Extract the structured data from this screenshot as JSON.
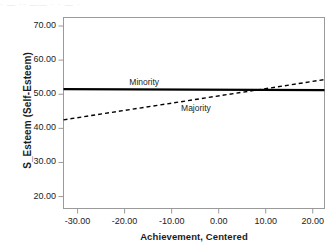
{
  "figure": {
    "background_color": "#ffffff",
    "frame_color": "#9a9a9a",
    "line_color": "#000000",
    "top_artifact_text": "· — ·· —— · · — ·"
  },
  "chart_data": {
    "type": "line",
    "title": "",
    "xlabel": "Achievement, Centered",
    "ylabel": "S_Esteem (Self-Esteem)",
    "xlim": [
      -33.0,
      22.5
    ],
    "ylim": [
      16.5,
      72.5
    ],
    "xticks": [
      -30.0,
      -20.0,
      -10.0,
      0.0,
      10.0,
      20.0
    ],
    "xtick_labels": [
      "-30.00",
      "-20.00",
      "-10.00",
      "0.00",
      "10.00",
      "20.00"
    ],
    "yticks": [
      20.0,
      30.0,
      40.0,
      50.0,
      60.0,
      70.0
    ],
    "ytick_labels": [
      "20.00",
      "30.00",
      "40.00",
      "50.00",
      "60.00",
      "70.00"
    ],
    "grid": false,
    "legend_position": "inline-annotations",
    "series": [
      {
        "name": "Minority",
        "style": "solid",
        "linewidth": 2.2,
        "color": "#000000",
        "x": [
          -33.0,
          22.5
        ],
        "values": [
          51.5,
          51.2
        ],
        "annotation": {
          "text": "Minority",
          "x": -19.0,
          "y": 53.2
        }
      },
      {
        "name": "Majority",
        "style": "dashed",
        "linewidth": 1.4,
        "color": "#000000",
        "x": [
          -33.0,
          22.5
        ],
        "values": [
          42.5,
          54.3
        ],
        "annotation": {
          "text": "Majority",
          "x": -8.0,
          "y": 45.6
        }
      }
    ],
    "intersection": {
      "x": 8.2,
      "y": 51.2
    }
  }
}
